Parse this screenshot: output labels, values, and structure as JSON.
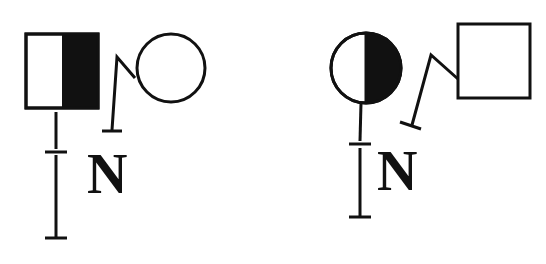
{
  "diagram": {
    "type": "pedigree",
    "colors": {
      "line": "#111111",
      "fill_affected": "#111111",
      "background": "#ffffff"
    },
    "left_group": {
      "proband": {
        "shape": "square",
        "sex": "male",
        "shading": "right-half-filled"
      },
      "partner": {
        "shape": "circle",
        "sex": "female",
        "shading": "none"
      },
      "label": "N"
    },
    "right_group": {
      "proband": {
        "shape": "circle",
        "sex": "female",
        "shading": "right-half-filled"
      },
      "partner": {
        "shape": "square",
        "sex": "male",
        "shading": "none"
      },
      "label": "N"
    }
  }
}
